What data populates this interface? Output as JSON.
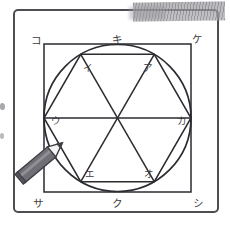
{
  "figure": {
    "colors": {
      "frame": "#4d4d52",
      "ink": "#2b2b30",
      "label": "#3b3b40",
      "smudge": "#8c8c91",
      "pencil_body": "#6f6f75",
      "pencil_tip": "#f2f2f2",
      "page": "#ffffff"
    },
    "square_corner_labels": [
      {
        "id": "ko",
        "text": "コ",
        "x": 36,
        "y": 40
      },
      {
        "id": "ke",
        "text": "ケ",
        "x": 197,
        "y": 39
      },
      {
        "id": "sa",
        "text": "サ",
        "x": 38,
        "y": 203
      },
      {
        "id": "shi",
        "text": "シ",
        "x": 198,
        "y": 203
      }
    ],
    "square_edge_labels": [
      {
        "id": "ki",
        "text": "キ",
        "x": 117,
        "y": 39
      },
      {
        "id": "ku",
        "text": "ク",
        "x": 117,
        "y": 203
      }
    ],
    "hexagon_vertex_labels": [
      {
        "id": "a",
        "text": "ア",
        "x": 148,
        "y": 68
      },
      {
        "id": "i",
        "text": "イ",
        "x": 88,
        "y": 68
      },
      {
        "id": "u",
        "text": "ウ",
        "x": 56,
        "y": 121
      },
      {
        "id": "e",
        "text": "エ",
        "x": 90,
        "y": 174
      },
      {
        "id": "o",
        "text": "オ",
        "x": 149,
        "y": 174
      },
      {
        "id": "ka",
        "text": "カ",
        "x": 182,
        "y": 121
      }
    ],
    "annotations": {
      "pencil_icon": "pencil-icon",
      "smudge": "pencil-smudge",
      "edge_marks": "cropped-edge-marks"
    }
  }
}
